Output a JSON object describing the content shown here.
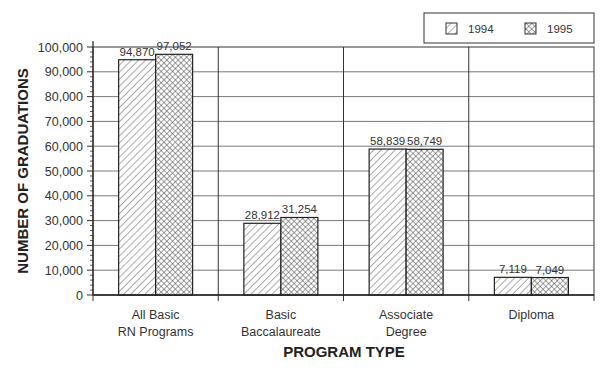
{
  "chart_data": {
    "type": "bar",
    "title": "",
    "xlabel": "PROGRAM TYPE",
    "ylabel": "NUMBER OF GRADUATIONS",
    "ylim": [
      0,
      100000
    ],
    "yticks": [
      0,
      10000,
      20000,
      30000,
      40000,
      50000,
      60000,
      70000,
      80000,
      90000,
      100000
    ],
    "ytick_labels": [
      "0",
      "10,000",
      "20,000",
      "30,000",
      "40,000",
      "50,000",
      "60,000",
      "70,000",
      "80,000",
      "90,000",
      "100,000"
    ],
    "grid": true,
    "legend_position": "top-right",
    "categories": [
      [
        "All Basic",
        "RN Programs"
      ],
      [
        "Basic",
        "Baccalaureate"
      ],
      [
        "Associate",
        "Degree"
      ],
      [
        "Diploma"
      ]
    ],
    "series": [
      {
        "name": "1994",
        "pattern": "diagonal-hatch",
        "values": [
          94870,
          28912,
          58839,
          7119
        ],
        "labels": [
          "94,870",
          "28,912",
          "58,839",
          "7,119"
        ]
      },
      {
        "name": "1995",
        "pattern": "cross-hatch",
        "values": [
          97052,
          31254,
          58749,
          7049
        ],
        "labels": [
          "97,052",
          "31,254",
          "58,749",
          "7,049"
        ]
      }
    ]
  }
}
